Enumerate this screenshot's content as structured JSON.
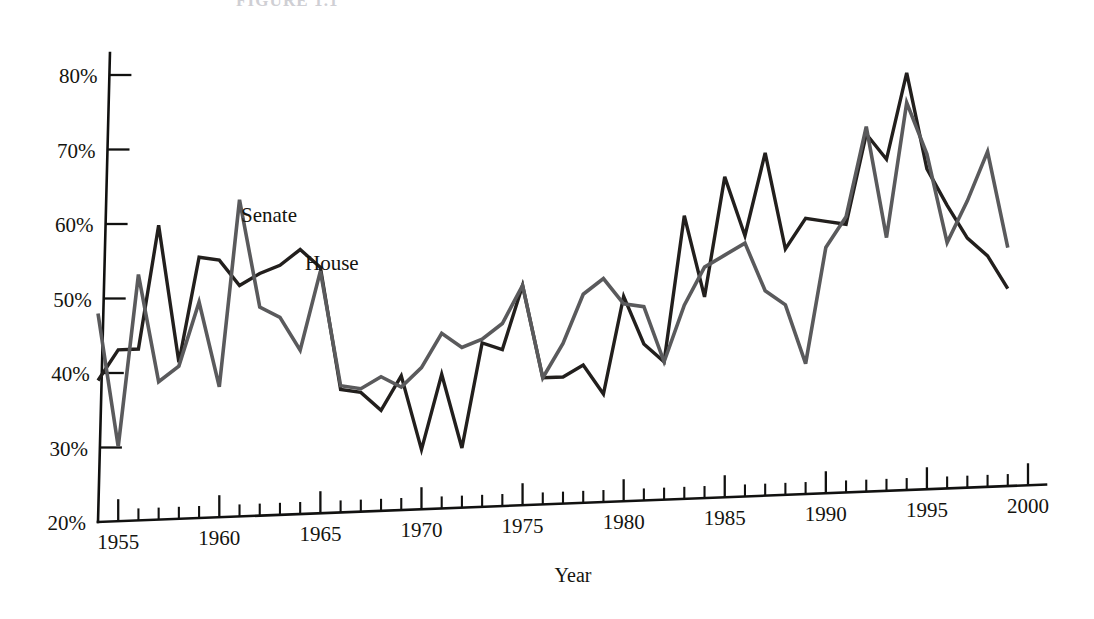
{
  "figure": {
    "caption_partial": "FIGURE 1.1",
    "background_color": "#ffffff"
  },
  "annotations": {
    "senate_label": "Senate",
    "house_label": "House"
  },
  "axes": {
    "x_title": "Year",
    "y_title": "",
    "y_tick_labels": [
      "80%",
      "70%",
      "60%",
      "50%",
      "40%",
      "30%",
      "20%"
    ],
    "x_tick_labels": [
      "1955",
      "1960",
      "1965",
      "1970",
      "1975",
      "1980",
      "1985",
      "1990",
      "1995",
      "2000"
    ]
  },
  "colors": {
    "house_line": "#221f1d",
    "senate_line": "#5a5a5c",
    "axis": "#111110",
    "text": "#14140f",
    "caption": "#cfcfd4"
  },
  "chart_data": {
    "type": "line",
    "title": "",
    "subtitle": "",
    "xlabel": "Year",
    "ylabel": "",
    "xlim": [
      1954,
      2000
    ],
    "ylim": [
      20,
      80
    ],
    "y_unit": "percent",
    "ytick_values": [
      20,
      30,
      40,
      50,
      60,
      70,
      80
    ],
    "xtick_values": [
      1955,
      1960,
      1965,
      1970,
      1975,
      1980,
      1985,
      1990,
      1995,
      2000
    ],
    "xtick_interval_minor": 1,
    "grid": false,
    "legend": "inline-annotations",
    "x": [
      1954,
      1955,
      1956,
      1957,
      1958,
      1959,
      1960,
      1961,
      1962,
      1963,
      1964,
      1965,
      1966,
      1967,
      1968,
      1969,
      1970,
      1971,
      1972,
      1973,
      1974,
      1975,
      1976,
      1977,
      1978,
      1979,
      1980,
      1981,
      1982,
      1983,
      1984,
      1985,
      1986,
      1987,
      1988,
      1989,
      1990,
      1991,
      1992,
      1993,
      1994,
      1995,
      1996,
      1997,
      1998,
      1999
    ],
    "series": [
      {
        "name": "House",
        "color": "#221f1d",
        "values": [
          39,
          43,
          43,
          59.5,
          41,
          55,
          54.5,
          51,
          52.5,
          53.5,
          55.5,
          53,
          36.5,
          36,
          33.5,
          38,
          28,
          38,
          28,
          42,
          41,
          49.5,
          37,
          37,
          38.5,
          34.5,
          47.5,
          41,
          38.5,
          58,
          47,
          63,
          55,
          66,
          53,
          57,
          56.5,
          56,
          68,
          64.5,
          76,
          63,
          58,
          53.5,
          51,
          46.5
        ]
      },
      {
        "name": "Senate",
        "color": "#5a5a5c",
        "values": [
          48,
          30,
          53,
          38.5,
          40.5,
          49,
          37.5,
          62.5,
          48,
          46.5,
          42,
          52.5,
          37,
          36.5,
          38,
          36.5,
          39,
          43.5,
          41.5,
          42.5,
          44.5,
          49.5,
          37,
          41.5,
          48,
          50,
          46.5,
          46,
          38.5,
          46,
          51,
          52.5,
          54,
          47.5,
          45.5,
          37.5,
          53,
          57,
          69,
          54,
          72,
          65,
          53,
          58.5,
          65,
          52
        ]
      }
    ]
  }
}
